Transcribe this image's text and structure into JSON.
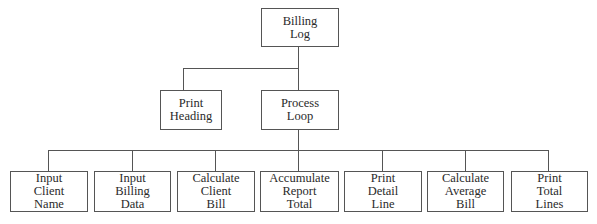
{
  "diagram": {
    "type": "hierarchy-chart",
    "root": {
      "label_lines": [
        "Billing",
        "Log"
      ]
    },
    "level2": [
      {
        "label_lines": [
          "Print",
          "Heading"
        ]
      },
      {
        "label_lines": [
          "Process",
          "Loop"
        ]
      }
    ],
    "level3": [
      {
        "label_lines": [
          "Input",
          "Client",
          "Name"
        ]
      },
      {
        "label_lines": [
          "Input",
          "Billing",
          "Data"
        ]
      },
      {
        "label_lines": [
          "Calculate",
          "Client",
          "Bill"
        ]
      },
      {
        "label_lines": [
          "Accumulate",
          "Report",
          "Total"
        ]
      },
      {
        "label_lines": [
          "Print",
          "Detail",
          "Line"
        ]
      },
      {
        "label_lines": [
          "Calculate",
          "Average",
          "Bill"
        ]
      },
      {
        "label_lines": [
          "Print",
          "Total",
          "Lines"
        ]
      }
    ],
    "colors": {
      "line": "#555555",
      "text": "#2a2a2a",
      "background": "#ffffff"
    }
  }
}
